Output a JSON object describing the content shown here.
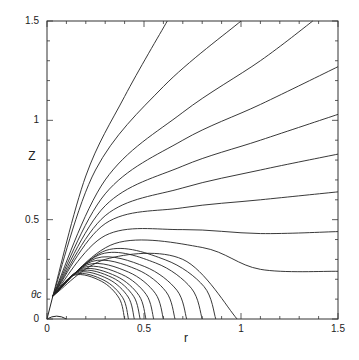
{
  "chart_data": {
    "type": "line",
    "title": "",
    "xlabel": "r",
    "ylabel": "Z",
    "xlim": [
      0,
      1.5
    ],
    "ylim": [
      0,
      1.5
    ],
    "grid": false,
    "legend": "none",
    "x_ticks": [
      {
        "v": 0,
        "label": "0"
      },
      {
        "v": 0.5,
        "label": "0.5"
      },
      {
        "v": 1,
        "label": "1"
      },
      {
        "v": 1.5,
        "label": "1.5"
      }
    ],
    "y_ticks": [
      {
        "v": 0,
        "label": "0"
      },
      {
        "v": 0.5,
        "label": "0.5"
      },
      {
        "v": 1,
        "label": "1"
      },
      {
        "v": 1.5,
        "label": "1.5"
      }
    ],
    "annotations": [
      {
        "text": "θc",
        "r": -0.04,
        "z": 0.115,
        "description": "cone angle marker at convergence point"
      }
    ],
    "source_point": {
      "r": 0.03,
      "z": 0.115
    },
    "inner_semicircle": {
      "radius": 0.1,
      "center": [
        0,
        0
      ]
    },
    "field_lines_to_axis_r": [
      0.4,
      0.42,
      0.45,
      0.48,
      0.51,
      0.55,
      0.6,
      0.66,
      0.72,
      0.8,
      0.87
    ],
    "field_lines_special": [
      {
        "name": "line-to-r-0.98",
        "points": [
          [
            0.03,
            0.115
          ],
          [
            0.3,
            0.3
          ],
          [
            0.7,
            0.3
          ],
          [
            0.98,
            0
          ]
        ]
      },
      {
        "name": "line-to-right-0.24",
        "points": [
          [
            0.03,
            0.115
          ],
          [
            0.35,
            0.38
          ],
          [
            0.8,
            0.36
          ],
          [
            1.1,
            0.25
          ],
          [
            1.5,
            0.24
          ]
        ]
      },
      {
        "name": "line-to-right-0.44",
        "points": [
          [
            0.03,
            0.115
          ],
          [
            0.3,
            0.42
          ],
          [
            0.7,
            0.45
          ],
          [
            1.1,
            0.43
          ],
          [
            1.5,
            0.44
          ]
        ]
      },
      {
        "name": "line-to-right-0.64",
        "points": [
          [
            0.03,
            0.115
          ],
          [
            0.3,
            0.48
          ],
          [
            0.7,
            0.56
          ],
          [
            1.1,
            0.6
          ],
          [
            1.5,
            0.64
          ]
        ]
      },
      {
        "name": "line-to-right-0.83",
        "points": [
          [
            0.03,
            0.115
          ],
          [
            0.3,
            0.52
          ],
          [
            0.7,
            0.66
          ],
          [
            1.1,
            0.75
          ],
          [
            1.5,
            0.83
          ]
        ]
      },
      {
        "name": "line-to-right-1.03",
        "points": [
          [
            0.03,
            0.115
          ],
          [
            0.3,
            0.57
          ],
          [
            0.7,
            0.77
          ],
          [
            1.1,
            0.9
          ],
          [
            1.5,
            1.03
          ]
        ]
      },
      {
        "name": "line-to-right-1.27",
        "points": [
          [
            0.03,
            0.115
          ],
          [
            0.3,
            0.63
          ],
          [
            0.7,
            0.9
          ],
          [
            1.1,
            1.08
          ],
          [
            1.5,
            1.27
          ]
        ]
      },
      {
        "name": "line-to-top-1.37",
        "points": [
          [
            0.03,
            0.115
          ],
          [
            0.3,
            0.7
          ],
          [
            0.7,
            1.04
          ],
          [
            1.1,
            1.3
          ],
          [
            1.37,
            1.5
          ]
        ]
      },
      {
        "name": "line-to-top-1.0",
        "points": [
          [
            0.03,
            0.115
          ],
          [
            0.25,
            0.75
          ],
          [
            0.6,
            1.17
          ],
          [
            1.0,
            1.5
          ]
        ]
      },
      {
        "name": "line-to-top-0.62",
        "points": [
          [
            0.03,
            0.115
          ],
          [
            0.2,
            0.72
          ],
          [
            0.4,
            1.12
          ],
          [
            0.62,
            1.5
          ]
        ]
      }
    ]
  }
}
